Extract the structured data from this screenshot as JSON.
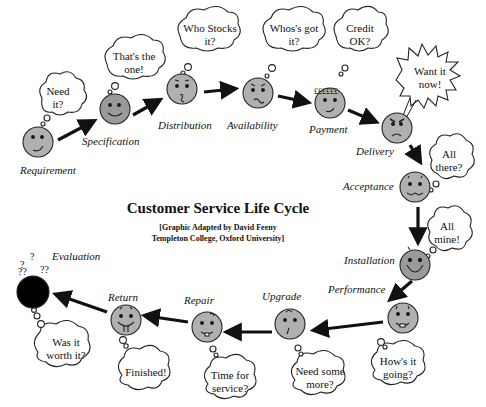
{
  "title": "Customer Service Life Cycle",
  "subtitle_line1": "[Graphic Adapted by David Feeny",
  "subtitle_line2": "Templeton College, Oxford University]",
  "colors": {
    "face": "#a8a8a8",
    "face_dark": "#000000",
    "arrow": "#111111",
    "outline": "#222222",
    "background": "#ffffff"
  },
  "stages": [
    {
      "id": "requirement",
      "label": "Requirement",
      "thought": [
        "Need",
        "it?"
      ]
    },
    {
      "id": "specification",
      "label": "Specification",
      "thought": [
        "That's the",
        "one!"
      ]
    },
    {
      "id": "distribution",
      "label": "Distribution",
      "thought": [
        "Who Stocks",
        "it?"
      ]
    },
    {
      "id": "availability",
      "label": "Availability",
      "thought": [
        "Whos's got",
        "it?"
      ]
    },
    {
      "id": "payment",
      "label": "Payment",
      "thought": [
        "Credit",
        "OK?"
      ]
    },
    {
      "id": "delivery",
      "label": "Delivery",
      "thought": [
        "Want it",
        "now!"
      ]
    },
    {
      "id": "acceptance",
      "label": "Acceptance",
      "thought": [
        "All",
        "there?"
      ]
    },
    {
      "id": "installation",
      "label": "Installation",
      "thought": [
        "All",
        "mine!"
      ]
    },
    {
      "id": "performance",
      "label": "Performance",
      "thought": [
        "How's it",
        "going?"
      ]
    },
    {
      "id": "upgrade",
      "label": "Upgrade",
      "thought": [
        "Need some",
        "more?"
      ]
    },
    {
      "id": "repair",
      "label": "Repair",
      "thought": [
        "Time for",
        "service?"
      ]
    },
    {
      "id": "return",
      "label": "Return",
      "thought": [
        "Finished!"
      ]
    },
    {
      "id": "evaluation",
      "label": "Evaluation",
      "thought": [
        "Was it",
        "worth it?"
      ],
      "marks": "?"
    }
  ]
}
